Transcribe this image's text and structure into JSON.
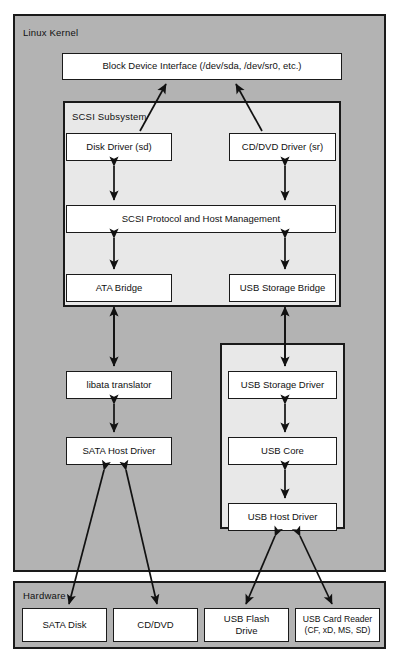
{
  "figure": {
    "caption": "",
    "colors": {
      "panel_fill": "#b3b3b3",
      "subpanel_fill": "#e8e8e8",
      "node_fill": "#ffffff",
      "stroke": "#1a1a1a",
      "page_bg": "#ffffff"
    }
  },
  "kernel": {
    "label": "Linux Kernel",
    "block_device_interface": "Block Device Interface (/dev/sda, /dev/sr0, etc.)",
    "scsi_subsystem": {
      "label": "SCSI Subsystem",
      "disk_driver": "Disk Driver (sd)",
      "cd_dvd_driver": "CD/DVD Driver (sr)",
      "scsi_protocol": "SCSI Protocol and Host Management",
      "ata_bridge": "ATA Bridge",
      "usb_storage_bridge": "USB Storage Bridge"
    },
    "libata_translator": "libata translator",
    "sata_host_driver": "SATA Host Driver",
    "usb_stack": {
      "usb_storage_driver": "USB Storage Driver",
      "usb_core": "USB Core",
      "usb_host_driver": "USB Host Driver"
    }
  },
  "hardware": {
    "label": "Hardware",
    "devices": [
      {
        "line1": "SATA Disk",
        "line2": ""
      },
      {
        "line1": "CD/DVD",
        "line2": ""
      },
      {
        "line1": "USB Flash",
        "line2": "Drive"
      },
      {
        "line1": "USB Card Reader",
        "line2": "(CF, xD, MS, SD)"
      }
    ]
  },
  "connections": [
    {
      "from": "disk-driver",
      "to": "block-device-interface",
      "style": "single-arrow-up"
    },
    {
      "from": "cd-dvd-driver",
      "to": "block-device-interface",
      "style": "single-arrow-up"
    },
    {
      "from": "disk-driver",
      "to": "scsi-protocol",
      "style": "double-arrow-vertical"
    },
    {
      "from": "cd-dvd-driver",
      "to": "scsi-protocol",
      "style": "double-arrow-vertical"
    },
    {
      "from": "scsi-protocol",
      "to": "ata-bridge",
      "style": "double-arrow-vertical"
    },
    {
      "from": "scsi-protocol",
      "to": "usb-storage-bridge",
      "style": "double-arrow-vertical"
    },
    {
      "from": "libata-translator",
      "to": "ata-bridge",
      "style": "single-arrow-up"
    },
    {
      "from": "usb-storage-driver",
      "to": "usb-storage-bridge",
      "style": "single-arrow-up"
    },
    {
      "from": "libata-translator",
      "to": "sata-host-driver",
      "style": "double-arrow-vertical"
    },
    {
      "from": "usb-storage-driver",
      "to": "usb-core",
      "style": "double-arrow-vertical"
    },
    {
      "from": "usb-core",
      "to": "usb-host-driver",
      "style": "double-arrow-vertical"
    },
    {
      "from": "sata-host-driver",
      "to": "hw-sata-disk",
      "style": "double-arrow-diagonal"
    },
    {
      "from": "sata-host-driver",
      "to": "hw-cd-dvd",
      "style": "double-arrow-diagonal"
    },
    {
      "from": "usb-host-driver",
      "to": "hw-usb-flash-drive",
      "style": "double-arrow-diagonal"
    },
    {
      "from": "usb-host-driver",
      "to": "hw-usb-card-reader",
      "style": "double-arrow-diagonal"
    }
  ]
}
